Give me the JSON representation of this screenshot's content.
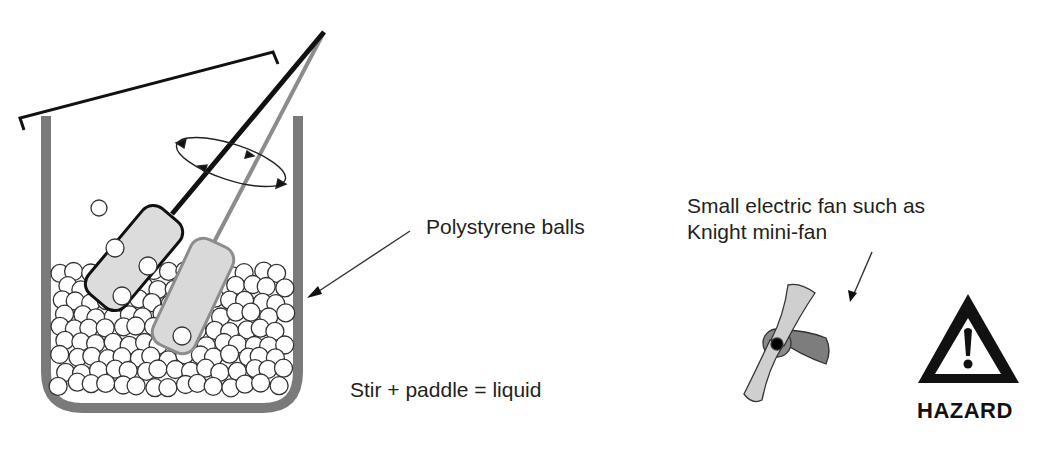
{
  "diagram": {
    "beaker": {
      "label": "Polystyrene balls",
      "wall_color": "#7a7a7a",
      "ball_fill": "#ffffff",
      "ball_stroke": "#333333"
    },
    "stirrer": {
      "paddle_color": "#d9d9d9",
      "rod_dark_color": "#111111",
      "rod_light_color": "#8c8c8c",
      "motion_indicator": "rotation-ellipse-arrows"
    },
    "caption": "Stir + paddle = liquid",
    "fan": {
      "label_line1": "Small electric fan such as",
      "label_line2": "Knight mini-fan",
      "blade_light": "#cfcfcf",
      "blade_dark": "#7d7d7d",
      "hub_color": "#000000"
    },
    "hazard": {
      "icon": "warning-triangle-icon",
      "label": "HAZARD"
    }
  }
}
